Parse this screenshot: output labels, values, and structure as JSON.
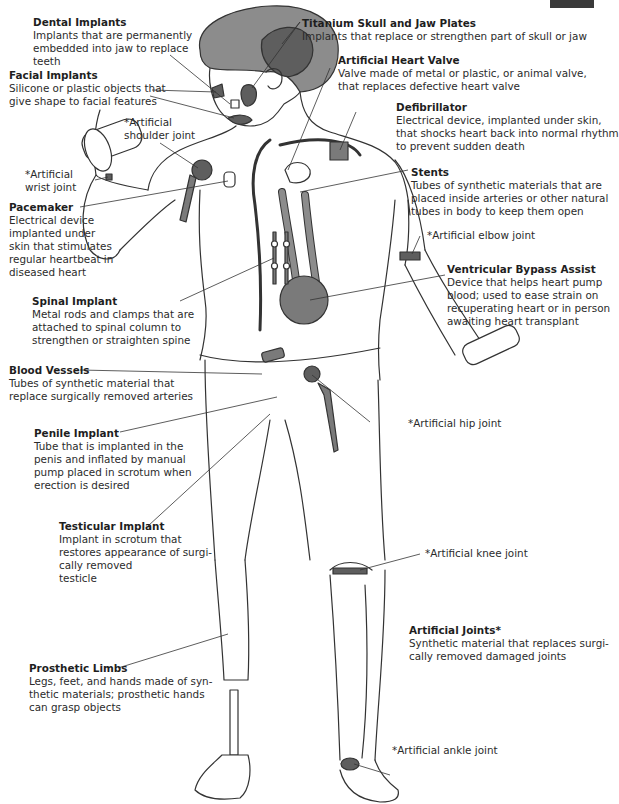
{
  "figure": {
    "type": "anatomical-illustration",
    "colors": {
      "line": "#333333",
      "implant_fill": "#7a7a7a",
      "implant_dark": "#5e5e5e",
      "skin_fill": "#ffffff",
      "hair_fill": "#8c8c8c",
      "corner_tab": "#3a3a3a"
    }
  },
  "labels": {
    "dental": {
      "title": "Dental Implants",
      "desc": "Implants that are permanently\nembedded into jaw to replace\nteeth"
    },
    "facial": {
      "title": "Facial Implants",
      "desc": "Silicone or plastic objects that\ngive shape to facial features"
    },
    "skull": {
      "title": "Titanium Skull and Jaw Plates",
      "desc": "Implants that replace or strengthen part of skull or jaw"
    },
    "heart_valve": {
      "title": "Artificial Heart Valve",
      "desc": "Valve made of metal or plastic, or animal valve,\nthat replaces defective heart valve"
    },
    "defibrillator": {
      "title": "Defibrillator",
      "desc": "Electrical device, implanted under skin,\nthat shocks heart back into normal rhythm\nto prevent sudden death"
    },
    "stents": {
      "title": "Stents",
      "desc": "Tubes of synthetic materials that are\nplaced inside arteries or other natural\ntubes in body to keep them open"
    },
    "pacemaker": {
      "title": "Pacemaker",
      "desc": "Electrical device\nimplanted under\nskin that stimulates\nregular heartbeat in\ndiseased heart"
    },
    "ventricular": {
      "title": "Ventricular Bypass Assist",
      "desc": "Device that helps heart pump\nblood; used to ease strain on\nrecuperating heart or in person\nawaiting heart transplant"
    },
    "spinal": {
      "title": "Spinal Implant",
      "desc": "Metal rods and clamps that are\nattached to spinal column to\nstrengthen or straighten spine"
    },
    "blood_vessels": {
      "title": "Blood Vessels",
      "desc": "Tubes of synthetic material that\nreplace surgically removed arteries"
    },
    "penile": {
      "title": "Penile Implant",
      "desc": "Tube that is implanted in the\npenis and inflated by manual\npump placed in scrotum when\nerection is desired"
    },
    "testicular": {
      "title": "Testicular Implant",
      "desc": "Implant in scrotum that\nrestores appearance of surgi-\ncally removed\ntesticle"
    },
    "prosthetic": {
      "title": "Prosthetic Limbs",
      "desc": "Legs, feet, and hands made of syn-\nthetic materials; prosthetic hands\ncan grasp objects"
    },
    "joints": {
      "title": "Artificial Joints*",
      "desc": "Synthetic material that replaces surgi-\ncally removed damaged joints"
    }
  },
  "joints": {
    "shoulder": "*Artificial\nshoulder joint",
    "wrist": "*Artificial\nwrist joint",
    "elbow": "*Artificial elbow joint",
    "hip": "*Artificial hip joint",
    "knee": "*Artificial knee joint",
    "ankle": "*Artificial ankle joint"
  }
}
